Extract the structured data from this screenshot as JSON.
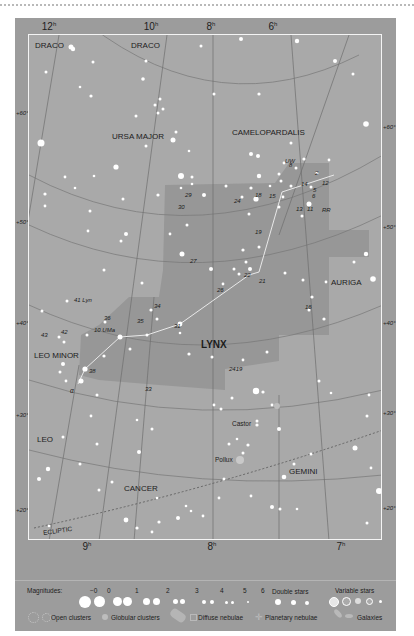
{
  "chart_title": "LYNX",
  "ra_labels_top": [
    {
      "text": "12",
      "unit": "h",
      "x": 49
    },
    {
      "text": "10",
      "unit": "h",
      "x": 151
    },
    {
      "text": "8",
      "unit": "h",
      "x": 211
    },
    {
      "text": "6",
      "unit": "h",
      "x": 273
    }
  ],
  "ra_labels_bottom": [
    {
      "text": "9",
      "unit": "h",
      "x": 87
    },
    {
      "text": "8",
      "unit": "h",
      "x": 212
    },
    {
      "text": "7",
      "unit": "h",
      "x": 341
    }
  ],
  "dec_labels_left": [
    "+60°",
    "+50°",
    "+40°",
    "+30°",
    "+20°"
  ],
  "dec_labels_right": [
    "+60°",
    "+50°",
    "+40°",
    "+30°",
    "+20°"
  ],
  "constellations": {
    "draco_1": "DRACO",
    "draco_2": "DRACO",
    "ursa_major": "URSA MAJOR",
    "camelopardalis": "CAMELOPARDALIS",
    "auriga": "AURIGA",
    "lynx": "LYNX",
    "leo_minor": "LEO MINOR",
    "leo": "LEO",
    "cancer": "CANCER",
    "gemini": "GEMINI"
  },
  "ecliptic_label": "ECLIPTIC",
  "star_names": {
    "castor": "Castor",
    "pollux": "Pollux",
    "alpha": "α"
  },
  "star_labels": [
    {
      "t": "UW",
      "x": 256,
      "y": 123
    },
    {
      "t": "8",
      "x": 260,
      "y": 127
    },
    {
      "t": "2",
      "x": 286,
      "y": 135
    },
    {
      "t": "14",
      "x": 272,
      "y": 146
    },
    {
      "t": "12",
      "x": 293,
      "y": 145
    },
    {
      "t": "5",
      "x": 284,
      "y": 152
    },
    {
      "t": "6",
      "x": 283,
      "y": 158
    },
    {
      "t": "18",
      "x": 226,
      "y": 157
    },
    {
      "t": "15",
      "x": 240,
      "y": 158
    },
    {
      "t": "13",
      "x": 267,
      "y": 171
    },
    {
      "t": "11",
      "x": 278,
      "y": 171
    },
    {
      "t": "RR",
      "x": 293,
      "y": 172
    },
    {
      "t": "29",
      "x": 156,
      "y": 157
    },
    {
      "t": "24",
      "x": 205,
      "y": 163
    },
    {
      "t": "30",
      "x": 149,
      "y": 169
    },
    {
      "t": "19",
      "x": 226,
      "y": 194
    },
    {
      "t": "27",
      "x": 161,
      "y": 223
    },
    {
      "t": "22",
      "x": 215,
      "y": 237
    },
    {
      "t": "21",
      "x": 230,
      "y": 243
    },
    {
      "t": "26",
      "x": 188,
      "y": 252
    },
    {
      "t": "16",
      "x": 276,
      "y": 269
    },
    {
      "t": "41 Lyn",
      "x": 45,
      "y": 262
    },
    {
      "t": "34",
      "x": 125,
      "y": 268
    },
    {
      "t": "36",
      "x": 75,
      "y": 280
    },
    {
      "t": "35",
      "x": 108,
      "y": 283
    },
    {
      "t": "31",
      "x": 145,
      "y": 288
    },
    {
      "t": "10 UMa",
      "x": 65,
      "y": 292
    },
    {
      "t": "42",
      "x": 32,
      "y": 294
    },
    {
      "t": "43",
      "x": 12,
      "y": 297
    },
    {
      "t": "38",
      "x": 60,
      "y": 333
    },
    {
      "t": "2419",
      "x": 200,
      "y": 331
    },
    {
      "t": "33",
      "x": 116,
      "y": 351
    }
  ],
  "legend": {
    "magnitudes_label": "Magnitudes:",
    "magnitudes": [
      "−0",
      "0",
      "1",
      "2",
      "3",
      "4",
      "5",
      "6"
    ],
    "double_stars": "Double stars",
    "variable_stars": "Variable stars",
    "open_clusters": "Open clusters",
    "globular_clusters": "Globular clusters",
    "diffuse_nebulae": "Diffuse nebulae",
    "planetary_nebulae": "Planetary nebulae",
    "galaxies": "Galaxies"
  },
  "colors": {
    "frame": "#9c9c9c",
    "sky": "#a9a9a9",
    "lynx_region": "#979797",
    "border": "#f4f4f4",
    "stars": "#ffffff"
  }
}
